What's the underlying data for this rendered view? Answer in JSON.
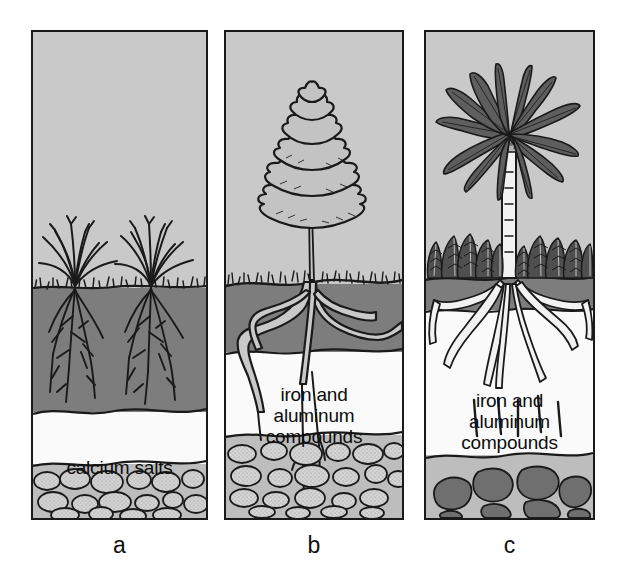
{
  "figure": {
    "background_color": "#ffffff"
  },
  "panels": [
    {
      "id": "a",
      "caption": "a",
      "vegetation": "bunch grasses",
      "soil_label": "calcium salts",
      "layers": [
        {
          "name": "air",
          "color": "#c9c9c9"
        },
        {
          "name": "dark topsoil",
          "color": "#7d7d7d"
        },
        {
          "name": "calcium salts",
          "color": "#fafafa"
        },
        {
          "name": "parent rock",
          "color": "#bdbdbd"
        }
      ]
    },
    {
      "id": "b",
      "caption": "b",
      "vegetation": "conifer tree with grass",
      "soil_label": "iron and\naluminum\ncompounds",
      "soil_label_lines": [
        "iron and",
        "aluminum",
        "compounds"
      ],
      "layers": [
        {
          "name": "air",
          "color": "#c9c9c9"
        },
        {
          "name": "dark topsoil",
          "color": "#7d7d7d"
        },
        {
          "name": "leached horizon",
          "color": "#fafafa"
        },
        {
          "name": "parent rock",
          "color": "#bdbdbd"
        }
      ]
    },
    {
      "id": "c",
      "caption": "c",
      "vegetation": "palm tree with ferns",
      "soil_label": "iron and\naluminum\ncompounds",
      "soil_label_lines": [
        "iron and",
        "aluminum",
        "compounds"
      ],
      "layers": [
        {
          "name": "air",
          "color": "#c9c9c9"
        },
        {
          "name": "thin dark topsoil",
          "color": "#7d7d7d"
        },
        {
          "name": "deep leached horizon",
          "color": "#fafafa"
        },
        {
          "name": "parent rock with dark clasts",
          "color": "#bdbdbd"
        }
      ]
    }
  ],
  "colors": {
    "sky": "#c9c9c9",
    "dark_soil": "#7d7d7d",
    "white_layer": "#fafafa",
    "rock_layer": "#bdbdbd",
    "rock_fill_light": "#d2d2d2",
    "rock_fill_dark": "#707070",
    "ink": "#1a1a1a"
  }
}
